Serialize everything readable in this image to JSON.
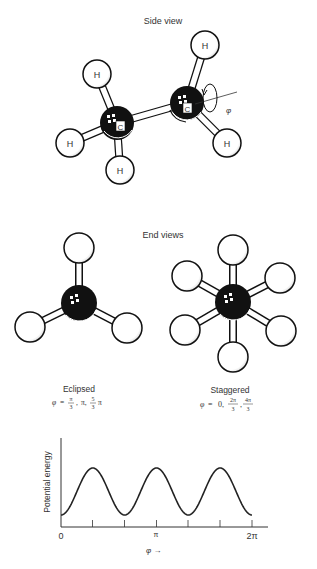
{
  "side_view": {
    "title": "Side view",
    "carbon_label": "C",
    "hydrogen_label": "H",
    "rotation_symbol": "φ"
  },
  "end_views": {
    "title": "End views",
    "eclipsed": {
      "label": "Eclipsed",
      "angles_prefix": "φ =",
      "angles": [
        "π/3",
        "π",
        "5/3 π"
      ]
    },
    "staggered": {
      "label": "Staggered",
      "angles_prefix": "φ =",
      "angles": [
        "0",
        "2π/3",
        "4π/3"
      ]
    }
  },
  "chart_data": {
    "type": "line",
    "title": "",
    "xlabel": "φ →",
    "ylabel": "Potential energy",
    "x_tick_labels": [
      "0",
      "π",
      "2π"
    ],
    "x_ticks": [
      "0",
      "π/3",
      "2π/3",
      "π",
      "4π/3",
      "5π/3",
      "2π"
    ],
    "xlim": [
      "0",
      "2π"
    ],
    "series": [
      {
        "name": "Potential energy",
        "function": "cos-like, period 2π/3, minima at 0, 2π/3, 4π/3, 2π; maxima at π/3, π, 5π/3",
        "x": [
          "0",
          "π/3",
          "2π/3",
          "π",
          "4π/3",
          "5π/3",
          "2π"
        ],
        "values": [
          "min",
          "max",
          "min",
          "max",
          "min",
          "max",
          "min"
        ]
      }
    ],
    "grid": false
  }
}
